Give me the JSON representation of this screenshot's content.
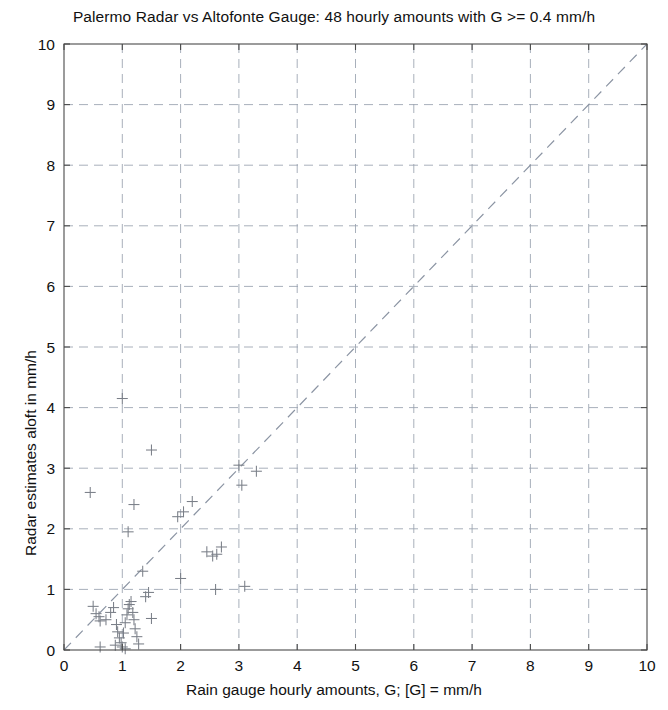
{
  "chart_data": {
    "type": "scatter",
    "title": "Palermo Radar vs Altofonte Gauge: 48 hourly amounts with G >= 0.4 mm/h",
    "xlabel": "Rain gauge hourly amounts, G; [G] = mm/h",
    "ylabel": "Radar estimates aloft in mm/h",
    "xlim": [
      0,
      10
    ],
    "ylim": [
      0,
      10
    ],
    "xticks": [
      0,
      1,
      2,
      3,
      4,
      5,
      6,
      7,
      8,
      9,
      10
    ],
    "yticks": [
      0,
      1,
      2,
      3,
      4,
      5,
      6,
      7,
      8,
      9,
      10
    ],
    "xtick_labels": [
      "0",
      "1",
      "2",
      "3",
      "4",
      "5",
      "6",
      "7",
      "8",
      "9",
      "10"
    ],
    "ytick_labels": [
      "0",
      "1",
      "2",
      "3",
      "4",
      "5",
      "6",
      "7",
      "8",
      "9",
      "10"
    ],
    "grid": true,
    "legend": null,
    "marker_style": "plus",
    "marker_color": "#7a7f88",
    "reference_line": {
      "label": "1:1 line",
      "style": "dashed",
      "color": "#8b94a3",
      "from": [
        0,
        0
      ],
      "to": [
        10,
        10
      ]
    },
    "n_points": 48,
    "series": [
      {
        "name": "Hourly pairs (gauge vs radar)",
        "points": [
          [
            0.45,
            2.6
          ],
          [
            1.0,
            4.15
          ],
          [
            1.5,
            3.3
          ],
          [
            1.2,
            2.4
          ],
          [
            1.1,
            1.95
          ],
          [
            1.35,
            1.3
          ],
          [
            1.95,
            2.2
          ],
          [
            2.05,
            2.28
          ],
          [
            2.2,
            2.45
          ],
          [
            2.0,
            1.18
          ],
          [
            2.45,
            1.62
          ],
          [
            2.55,
            1.55
          ],
          [
            2.62,
            1.58
          ],
          [
            2.7,
            1.7
          ],
          [
            2.6,
            1.0
          ],
          [
            3.0,
            3.05
          ],
          [
            3.05,
            2.72
          ],
          [
            3.3,
            2.95
          ],
          [
            3.1,
            1.05
          ],
          [
            0.5,
            0.72
          ],
          [
            0.55,
            0.6
          ],
          [
            0.6,
            0.55
          ],
          [
            0.62,
            0.48
          ],
          [
            0.72,
            0.5
          ],
          [
            0.8,
            0.62
          ],
          [
            0.85,
            0.7
          ],
          [
            0.9,
            0.42
          ],
          [
            0.92,
            0.3
          ],
          [
            0.95,
            0.2
          ],
          [
            0.98,
            0.12
          ],
          [
            1.0,
            0.05
          ],
          [
            1.02,
            0.28
          ],
          [
            1.05,
            0.45
          ],
          [
            1.08,
            0.58
          ],
          [
            1.1,
            0.68
          ],
          [
            1.12,
            0.75
          ],
          [
            1.15,
            0.8
          ],
          [
            1.18,
            0.62
          ],
          [
            1.2,
            0.5
          ],
          [
            1.22,
            0.35
          ],
          [
            1.25,
            0.22
          ],
          [
            1.28,
            0.1
          ],
          [
            1.4,
            0.88
          ],
          [
            1.45,
            0.95
          ],
          [
            1.5,
            0.52
          ],
          [
            0.62,
            0.05
          ],
          [
            0.88,
            0.08
          ],
          [
            1.05,
            0.02
          ]
        ]
      }
    ]
  }
}
